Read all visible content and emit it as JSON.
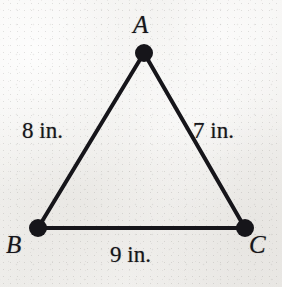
{
  "figure": {
    "type": "triangle-diagram",
    "background_color": "#f3f2f0",
    "ink_color": "#16151a",
    "vertices": [
      {
        "id": "A",
        "label": "A",
        "x": 144,
        "y": 53,
        "node_radius": 9
      },
      {
        "id": "B",
        "label": "B",
        "x": 38,
        "y": 228,
        "node_radius": 9
      },
      {
        "id": "C",
        "label": "C",
        "x": 245,
        "y": 228,
        "node_radius": 9
      }
    ],
    "sides": [
      {
        "id": "AB",
        "from": "A",
        "to": "B",
        "label": "8 in.",
        "length": 8,
        "unit": "in."
      },
      {
        "id": "AC",
        "from": "A",
        "to": "C",
        "label": "7 in.",
        "length": 7,
        "unit": "in."
      },
      {
        "id": "BC",
        "from": "B",
        "to": "C",
        "label": "9 in.",
        "length": 9,
        "unit": "in."
      }
    ],
    "stroke_width": 4
  }
}
